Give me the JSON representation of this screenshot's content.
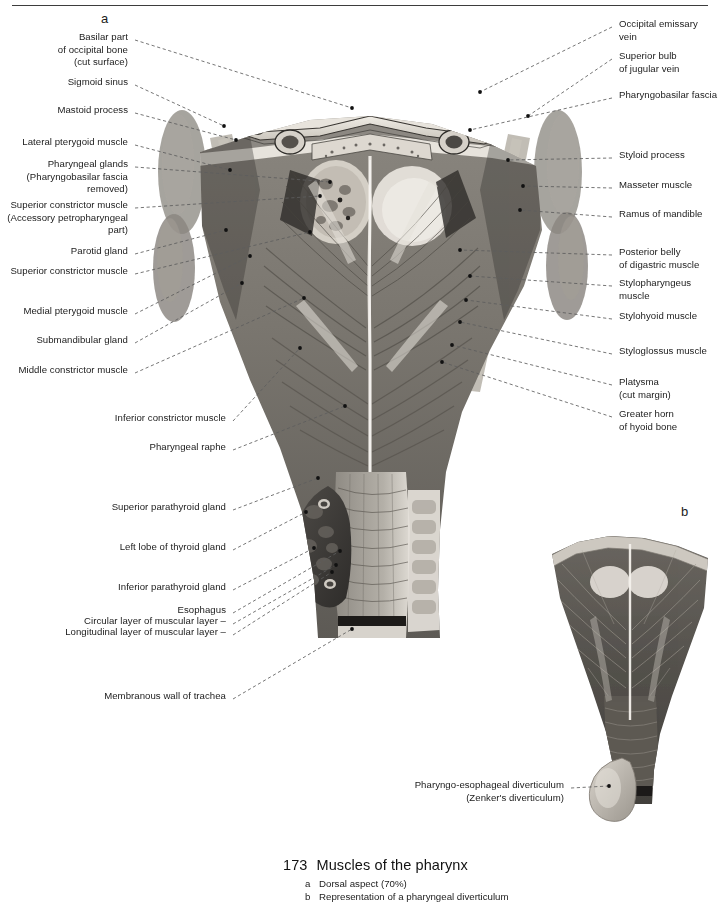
{
  "page": {
    "panel_letter_a": "a",
    "panel_letter_b": "b"
  },
  "labels_left": [
    {
      "text": "Basilar part\nof occipital bone\n(cut surface)",
      "x": 6,
      "y": 31,
      "w": 122,
      "anchor_x": 352,
      "anchor_y": 108
    },
    {
      "text": "Sigmoid sinus",
      "x": 6,
      "y": 76,
      "w": 122,
      "anchor_x": 224,
      "anchor_y": 126
    },
    {
      "text": "Mastoid process",
      "x": 6,
      "y": 104,
      "w": 122,
      "anchor_x": 236,
      "anchor_y": 140
    },
    {
      "text": "Lateral pterygoid muscle",
      "x": 6,
      "y": 136,
      "w": 122,
      "anchor_x": 230,
      "anchor_y": 170
    },
    {
      "text": "Pharyngeal glands\n(Pharyngobasilar fascia\nremoved)",
      "x": 2,
      "y": 158,
      "w": 126,
      "anchor_x": 330,
      "anchor_y": 182
    },
    {
      "text": "Superior constrictor muscle\n(Accessory petropharyngeal\npart)",
      "x": 0,
      "y": 199,
      "w": 128,
      "anchor_x": 320,
      "anchor_y": 196
    },
    {
      "text": "Parotid gland",
      "x": 6,
      "y": 245,
      "w": 122,
      "anchor_x": 226,
      "anchor_y": 230
    },
    {
      "text": "Superior constrictor muscle",
      "x": 6,
      "y": 265,
      "w": 122,
      "anchor_x": 310,
      "anchor_y": 232
    },
    {
      "text": "Medial pterygoid muscle",
      "x": 6,
      "y": 305,
      "w": 122,
      "anchor_x": 250,
      "anchor_y": 256
    },
    {
      "text": "Submandibular gland",
      "x": 6,
      "y": 334,
      "w": 122,
      "anchor_x": 242,
      "anchor_y": 283
    },
    {
      "text": "Middle constrictor muscle",
      "x": 6,
      "y": 364,
      "w": 122,
      "anchor_x": 304,
      "anchor_y": 298
    },
    {
      "text": "Inferior constrictor muscle",
      "x": 90,
      "y": 412,
      "w": 136,
      "anchor_x": 300,
      "anchor_y": 348
    },
    {
      "text": "Pharyngeal raphe",
      "x": 90,
      "y": 441,
      "w": 136,
      "anchor_x": 345,
      "anchor_y": 406
    },
    {
      "text": "Superior parathyroid gland",
      "x": 90,
      "y": 501,
      "w": 136,
      "anchor_x": 318,
      "anchor_y": 478
    },
    {
      "text": "Left lobe of thyroid gland",
      "x": 90,
      "y": 541,
      "w": 136,
      "anchor_x": 306,
      "anchor_y": 512
    },
    {
      "text": "Inferior parathyroid gland",
      "x": 90,
      "y": 581,
      "w": 136,
      "anchor_x": 314,
      "anchor_y": 548
    },
    {
      "text": "Esophagus",
      "x": 86,
      "y": 604,
      "w": 140,
      "anchor_x": 340,
      "anchor_y": 551
    },
    {
      "text": "Circular layer of muscular layer –",
      "x": 66,
      "y": 615,
      "w": 160,
      "anchor_x": 336,
      "anchor_y": 565
    },
    {
      "text": "Longitudinal layer of muscular layer –",
      "x": 46,
      "y": 626,
      "w": 180,
      "anchor_x": 332,
      "anchor_y": 572
    },
    {
      "text": "Membranous wall of trachea",
      "x": 90,
      "y": 690,
      "w": 136,
      "anchor_x": 352,
      "anchor_y": 629
    }
  ],
  "labels_right": [
    {
      "text": "Occipital emissary vein",
      "x": 619,
      "y": 18,
      "w": 99,
      "anchor_x": 480,
      "anchor_y": 92
    },
    {
      "text": "Superior bulb\nof jugular vein",
      "x": 619,
      "y": 50,
      "w": 99,
      "anchor_x": 528,
      "anchor_y": 116
    },
    {
      "text": "Pharyngobasilar fascia",
      "x": 619,
      "y": 89,
      "w": 99,
      "anchor_x": 470,
      "anchor_y": 130
    },
    {
      "text": "Styloid process",
      "x": 619,
      "y": 149,
      "w": 99,
      "anchor_x": 508,
      "anchor_y": 160
    },
    {
      "text": "Masseter muscle",
      "x": 619,
      "y": 179,
      "w": 99,
      "anchor_x": 523,
      "anchor_y": 186
    },
    {
      "text": "Ramus of mandible",
      "x": 619,
      "y": 208,
      "w": 99,
      "anchor_x": 520,
      "anchor_y": 210
    },
    {
      "text": "Posterior belly\nof digastric muscle",
      "x": 619,
      "y": 246,
      "w": 99,
      "anchor_x": 460,
      "anchor_y": 250
    },
    {
      "text": "Stylopharyngeus muscle",
      "x": 619,
      "y": 277,
      "w": 99,
      "anchor_x": 470,
      "anchor_y": 276
    },
    {
      "text": "Stylohyoid muscle",
      "x": 619,
      "y": 310,
      "w": 99,
      "anchor_x": 466,
      "anchor_y": 300
    },
    {
      "text": "Styloglossus muscle",
      "x": 619,
      "y": 345,
      "w": 99,
      "anchor_x": 460,
      "anchor_y": 322
    },
    {
      "text": "Platysma\n(cut margin)",
      "x": 619,
      "y": 376,
      "w": 99,
      "anchor_x": 452,
      "anchor_y": 345
    },
    {
      "text": "Greater horn\nof hyoid bone",
      "x": 619,
      "y": 408,
      "w": 99,
      "anchor_x": 442,
      "anchor_y": 362
    }
  ],
  "labels_figure_b": [
    {
      "text": "Pharyngo-esophageal diverticulum\n(Zenker's diverticulum)",
      "x": 404,
      "y": 779,
      "w": 160,
      "anchor_x": 609,
      "anchor_y": 786
    }
  ],
  "caption": {
    "number": "173",
    "title": "Muscles of the pharynx",
    "items": [
      {
        "key": "a",
        "text": "Dorsal aspect (70%)"
      },
      {
        "key": "b",
        "text": "Representation of a pharyngeal diverticulum"
      }
    ]
  },
  "colors": {
    "rule": "#3d3d3d",
    "text": "#1b1b1b",
    "leader": "#5d5d5d",
    "tissue_light": "#d9d5cf",
    "tissue_mid": "#9c9890",
    "tissue_dark": "#5e5b56",
    "tissue_darkest": "#383633",
    "raphe": "#f2efe9"
  }
}
